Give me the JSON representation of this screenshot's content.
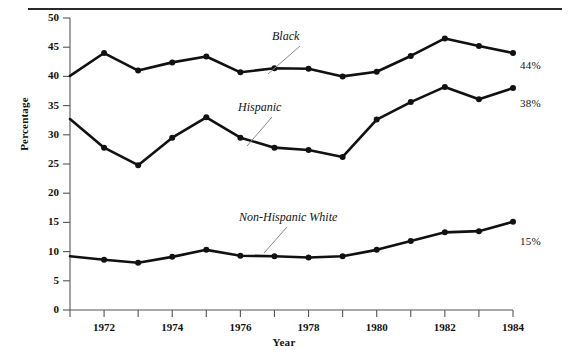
{
  "chart_data": {
    "type": "line",
    "title": "",
    "xlabel": "Year",
    "ylabel": "Percentage",
    "xlim": [
      1971,
      1984
    ],
    "ylim": [
      0,
      50
    ],
    "yticks": [
      0,
      5,
      10,
      15,
      20,
      25,
      30,
      35,
      40,
      45,
      50
    ],
    "ytick_labels": [
      "0",
      "5",
      "10",
      "15",
      "20",
      "25",
      "30",
      "35",
      "40",
      "45",
      "50"
    ],
    "xticks": [
      1971,
      1972,
      1973,
      1974,
      1975,
      1976,
      1977,
      1978,
      1979,
      1980,
      1981,
      1982,
      1983,
      1984
    ],
    "xtick_labels": [
      "1972",
      "1974",
      "1976",
      "1978",
      "1980",
      "1982",
      "1984"
    ],
    "xtick_labeled_years": [
      1972,
      1974,
      1976,
      1978,
      1980,
      1982,
      1984
    ],
    "grid": false,
    "legend_position": "inline-annotations",
    "x": [
      1971,
      1972,
      1973,
      1974,
      1975,
      1976,
      1977,
      1978,
      1979,
      1980,
      1981,
      1982,
      1983,
      1984
    ],
    "series": [
      {
        "name": "Black",
        "values": [
          40.1,
          44.0,
          41.0,
          42.4,
          43.4,
          40.7,
          41.4,
          41.3,
          40.0,
          40.8,
          43.5,
          46.5,
          45.2,
          44.0
        ],
        "end_label": "44%",
        "color": "#111111"
      },
      {
        "name": "Hispanic",
        "values": [
          32.7,
          27.8,
          24.8,
          29.5,
          33.0,
          29.5,
          27.8,
          27.4,
          26.2,
          32.6,
          35.6,
          38.2,
          36.1,
          38.0
        ],
        "end_label": "38%",
        "color": "#111111"
      },
      {
        "name": "Non-Hispanic White",
        "values": [
          9.2,
          8.6,
          8.1,
          9.1,
          10.3,
          9.3,
          9.2,
          9.0,
          9.2,
          10.3,
          11.8,
          13.3,
          13.5,
          15.1
        ],
        "end_label": "15%",
        "color": "#111111"
      }
    ],
    "annotations": [
      {
        "text": "Black",
        "series": "Black",
        "anchor_year": 1976
      },
      {
        "text": "Hispanic",
        "series": "Hispanic",
        "anchor_year": 1976
      },
      {
        "text": "Non-Hispanic White",
        "series": "Non-Hispanic White",
        "anchor_year": 1977
      }
    ]
  },
  "axis": {
    "y_title": "Percentage",
    "x_title": "Year",
    "y_labels": [
      "50",
      "45",
      "40",
      "35",
      "30",
      "25",
      "20",
      "15",
      "10",
      "5",
      "0"
    ],
    "x_labels": [
      "1972",
      "1974",
      "1976",
      "1978",
      "1980",
      "1982",
      "1984"
    ]
  },
  "series_labels": {
    "black": "Black",
    "hispanic": "Hispanic",
    "non_hispanic_white": "Non-Hispanic White"
  },
  "end_labels": {
    "black": "44%",
    "hispanic": "38%",
    "non_hispanic_white": "15%"
  },
  "colors": {
    "line": "#111111",
    "axis": "#555555",
    "rule": "#2a2a2a",
    "text": "#111111",
    "leader": "#888888"
  }
}
